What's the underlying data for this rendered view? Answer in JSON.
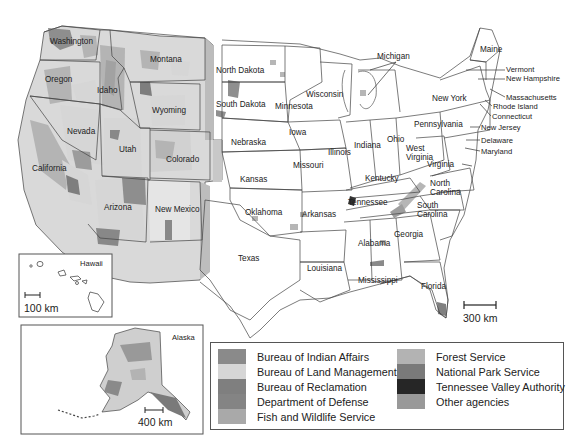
{
  "map": {
    "title": "Federal lands by managing agency",
    "state_labels": {
      "washington": "Washington",
      "oregon": "Oregon",
      "idaho": "Idaho",
      "montana": "Montana",
      "wyoming": "Wyoming",
      "nevada": "Nevada",
      "utah": "Utah",
      "colorado": "Colorado",
      "california": "California",
      "arizona": "Arizona",
      "new_mexico": "New Mexico",
      "north_dakota": "North Dakota",
      "south_dakota": "South Dakota",
      "nebraska": "Nebraska",
      "kansas": "Kansas",
      "oklahoma": "Oklahoma",
      "texas": "Texas",
      "minnesota": "Minnesota",
      "iowa": "Iowa",
      "missouri": "Missouri",
      "arkansas": "Arkansas",
      "louisiana": "Louisiana",
      "wisconsin": "Wisconsin",
      "michigan": "Michigan",
      "illinois": "Illinois",
      "indiana": "Indiana",
      "ohio": "Ohio",
      "kentucky": "Kentucky",
      "tennessee": "Tennessee",
      "mississippi": "Mississippi",
      "alabama": "Alabama",
      "georgia": "Georgia",
      "florida": "Florida",
      "south_carolina_1": "South",
      "south_carolina_2": "Carolina",
      "north_carolina_1": "North",
      "north_carolina_2": "Carolina",
      "virginia": "Virginia",
      "west_virginia_1": "West",
      "west_virginia_2": "Virginia",
      "pennsylvania": "Pennsylvania",
      "new_york": "New York",
      "maine": "Maine",
      "vermont": "Vermont",
      "new_hampshire": "New Hampshire",
      "massachusetts": "Massachusetts",
      "rhode_island": "Rhode Island",
      "connecticut": "Connecticut",
      "new_jersey": "New Jersey",
      "delaware": "Delaware",
      "maryland": "Maryland"
    },
    "scale_bars": {
      "contiguous": "300 km",
      "hawaii": "100 km",
      "alaska": "400 km"
    },
    "insets": {
      "hawaii": "Hawaii",
      "alaska": "Alaska"
    }
  },
  "legend": {
    "left": [
      {
        "label": "Bureau of Indian Affairs",
        "color": "#8a8a8a"
      },
      {
        "label": "Bureau of Land Management",
        "color": "#d6d6d6"
      },
      {
        "label": "Bureau of Reclamation",
        "color": "#7f7f7f"
      },
      {
        "label": "Department of Defense",
        "color": "#848484"
      },
      {
        "label": "Fish and Wildlife Service",
        "color": "#a9a9a9"
      }
    ],
    "right": [
      {
        "label": "Forest Service",
        "color": "#b3b3b3"
      },
      {
        "label": "National Park Service",
        "color": "#7a7a7a"
      },
      {
        "label": "Tennessee Valley Authority",
        "color": "#262626"
      },
      {
        "label": "Other agencies",
        "color": "#999999"
      }
    ]
  }
}
